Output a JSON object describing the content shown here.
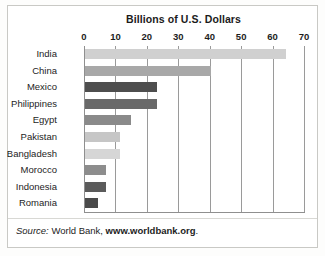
{
  "chart_data": {
    "type": "bar",
    "orientation": "horizontal",
    "title": "Billions of U.S. Dollars",
    "xlabel": "",
    "ylabel": "",
    "xlim": [
      0,
      70
    ],
    "xticks": [
      0,
      10,
      20,
      30,
      40,
      50,
      60,
      70
    ],
    "xtick_labels": [
      "0",
      "10",
      "20",
      "30",
      "40",
      "50",
      "60",
      "70"
    ],
    "grid": "vertical",
    "legend": "none",
    "categories": [
      "India",
      "China",
      "Mexico",
      "Philippines",
      "Egypt",
      "Pakistan",
      "Bangladesh",
      "Morocco",
      "Indonesia",
      "Romania"
    ],
    "values": [
      64,
      40,
      23,
      23,
      14.5,
      11,
      11,
      6.8,
      6.8,
      4
    ],
    "bar_colors": [
      "#d0d0d0",
      "#a8a8a8",
      "#4e4e4e",
      "#696969",
      "#8a8a8a",
      "#c6c6c6",
      "#d6d6d6",
      "#8d8d8d",
      "#5b5b5b",
      "#4a4a4a"
    ],
    "bars": [
      {
        "category": "India",
        "value": 64,
        "color": "#d0d0d0"
      },
      {
        "category": "China",
        "value": 40,
        "color": "#a8a8a8"
      },
      {
        "category": "Mexico",
        "value": 23,
        "color": "#4e4e4e"
      },
      {
        "category": "Philippines",
        "value": 23,
        "color": "#696969"
      },
      {
        "category": "Egypt",
        "value": 14.5,
        "color": "#8a8a8a"
      },
      {
        "category": "Pakistan",
        "value": 11,
        "color": "#c6c6c6"
      },
      {
        "category": "Bangladesh",
        "value": 11,
        "color": "#d6d6d6"
      },
      {
        "category": "Morocco",
        "value": 6.8,
        "color": "#8d8d8d"
      },
      {
        "category": "Indonesia",
        "value": 6.8,
        "color": "#5b5b5b"
      },
      {
        "category": "Romania",
        "value": 4,
        "color": "#4a4a4a"
      }
    ],
    "source": {
      "prefix": "Source:",
      "publisher": "World Bank,",
      "url": "www.worldbank.org",
      "suffix": "."
    }
  }
}
